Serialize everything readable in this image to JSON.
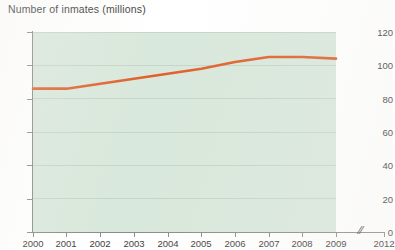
{
  "chart_data": {
    "type": "line",
    "title": "Number of inmates (millions)",
    "xlabel": "",
    "ylabel": "",
    "x": [
      2000,
      2001,
      2002,
      2003,
      2004,
      2005,
      2006,
      2007,
      2008,
      2009
    ],
    "values": [
      86,
      86,
      89,
      92,
      95,
      98,
      102,
      105,
      105,
      104
    ],
    "series": [
      {
        "name": "Number of inmates",
        "color": "#e0602c",
        "values": [
          86,
          86,
          89,
          92,
          95,
          98,
          102,
          105,
          105,
          104
        ]
      }
    ],
    "ylim": [
      0,
      120
    ],
    "yticks": [
      0,
      20,
      40,
      60,
      80,
      100,
      120
    ],
    "ytick_labels": [
      "0",
      "20",
      "40",
      "60",
      "80",
      "100",
      "120"
    ],
    "xticks": [
      2000,
      2001,
      2002,
      2003,
      2004,
      2005,
      2006,
      2007,
      2008,
      2009,
      2012
    ],
    "xtick_labels": [
      "2000",
      "2001",
      "2002",
      "2003",
      "2004",
      "2005",
      "2006",
      "2007",
      "2008",
      "2009",
      "2012"
    ],
    "axis_break": {
      "symbol": "//",
      "between": [
        "2009",
        "2012"
      ]
    },
    "grid": true,
    "legend": "none",
    "plot_background": "#d9e8dc",
    "gridline_color": "#c3d6c8",
    "axis_color": "#8a8a8a",
    "page_background": "#ffffff"
  }
}
